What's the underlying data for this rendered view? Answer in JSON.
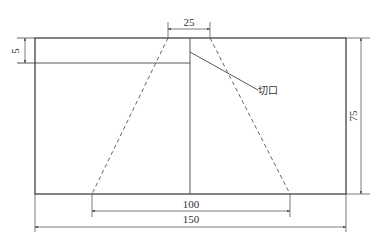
{
  "diagram": {
    "type": "technical-drawing",
    "units": "mm",
    "colors": {
      "line": "#333333",
      "dim": "#555555",
      "background": "#ffffff"
    },
    "dimensions": {
      "top_opening": "25",
      "left_strip_height": "5",
      "height": "75",
      "bottom_inner": "100",
      "total_width": "150"
    },
    "annotations": {
      "cut_label": "切口"
    }
  }
}
